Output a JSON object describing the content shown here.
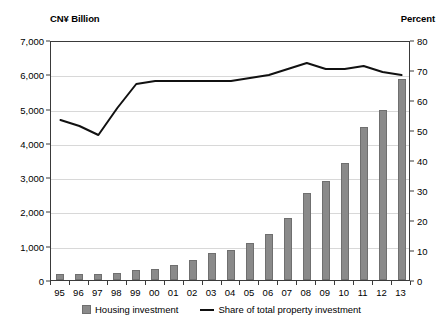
{
  "axis_titles": {
    "left": "CN¥ Billion",
    "right": "Percent"
  },
  "legend": {
    "bar_label": "Housing investment",
    "line_label": "Share of total property investment"
  },
  "colors": {
    "bar_fill": "#8a8a8a",
    "bar_edge": "#6f6f6f",
    "line": "#111111",
    "grid": "#d8d8d8",
    "axis": "#3a3a3a"
  },
  "chart_data": {
    "type": "bar",
    "title": "",
    "subtitle": "",
    "xlabel": "",
    "ylabel": "CN¥ Billion",
    "y2label": "Percent",
    "grid": true,
    "legend_position": "bottom",
    "categories": [
      "95",
      "96",
      "97",
      "98",
      "99",
      "00",
      "01",
      "02",
      "03",
      "04",
      "05",
      "06",
      "07",
      "08",
      "09",
      "10",
      "11",
      "12",
      "13"
    ],
    "ylim": [
      0,
      7000
    ],
    "yticks": [
      0,
      1000,
      2000,
      3000,
      4000,
      5000,
      6000,
      7000
    ],
    "ytick_labels": [
      "0",
      "1,000",
      "2,000",
      "3,000",
      "4,000",
      "5,000",
      "6,000",
      "7,000"
    ],
    "y2lim": [
      0,
      80
    ],
    "y2ticks": [
      0,
      10,
      20,
      30,
      40,
      50,
      60,
      70,
      80
    ],
    "y2tick_labels": [
      "0",
      "10",
      "20",
      "30",
      "40",
      "50",
      "60",
      "70",
      "80"
    ],
    "series": [
      {
        "name": "Housing investment",
        "type": "bar",
        "axis": "left",
        "unit": "CN¥ Billion",
        "values": [
          190,
          190,
          170,
          210,
          280,
          330,
          430,
          580,
          780,
          880,
          1080,
          1350,
          1800,
          2550,
          2900,
          3400,
          4450,
          4950,
          5850
        ]
      },
      {
        "name": "Share of total property investment",
        "type": "line",
        "axis": "right",
        "unit": "Percent",
        "values": [
          54,
          52,
          49,
          58,
          66,
          67,
          67,
          67,
          67,
          67,
          68,
          69,
          71,
          73,
          71,
          71,
          72,
          70,
          69
        ]
      }
    ]
  }
}
